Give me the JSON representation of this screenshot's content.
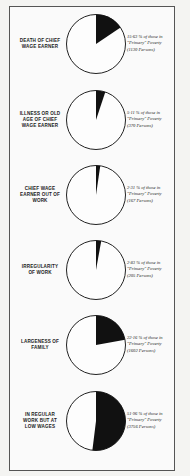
{
  "chart_data": {
    "type": "pie",
    "title": "",
    "charts": [
      {
        "cause": "Death of Chief Wage Earner",
        "percent": 15.63,
        "persons": 1130
      },
      {
        "cause": "Illness or Old Age of Chief Wage Earner",
        "percent": 5.11,
        "persons": 370
      },
      {
        "cause": "Chief Wage Earner Out of Work",
        "percent": 2.31,
        "persons": 167
      },
      {
        "cause": "Irregularity of Work",
        "percent": 2.83,
        "persons": 205
      },
      {
        "cause": "Largeness of Family",
        "percent": 22.16,
        "persons": 1602
      },
      {
        "cause": "In Regular Work but at Low Wages",
        "percent": 51.96,
        "persons": 3756
      }
    ],
    "legend": "Shaded sector = share of those in \"Primary\" Poverty"
  },
  "rows": [
    {
      "label_lines": [
        "Death of Chief",
        "Wage Earner"
      ],
      "caption": [
        "15·63 % of those in",
        "\"Primary\" Poverty",
        "(1130 Persons)"
      ],
      "percent": 15.63
    },
    {
      "label_lines": [
        "Illness or Old",
        "Age of Chief",
        "Wage Earner"
      ],
      "caption": [
        "5·11 % of those in",
        "\"Primary\" Poverty",
        "(370 Persons)"
      ],
      "percent": 5.11
    },
    {
      "label_lines": [
        "Chief Wage",
        "Earner Out of",
        "Work"
      ],
      "caption": [
        "2·31 % of those in",
        "\"Primary\" Poverty",
        "(167 Persons)"
      ],
      "percent": 2.31
    },
    {
      "label_lines": [
        "Irregularity",
        "of Work"
      ],
      "caption": [
        "2·83 % of those in",
        "\"Primary\" Poverty",
        "(205 Persons)"
      ],
      "percent": 2.83
    },
    {
      "label_lines": [
        "Largeness of",
        "Family"
      ],
      "caption": [
        "22·16 % of those in",
        "\"Primary\" Poverty",
        "(1602 Persons)"
      ],
      "percent": 22.16
    },
    {
      "label_lines": [
        "In Regular",
        "Work but at",
        "Low Wages"
      ],
      "caption": [
        "51·96 % of those in",
        "\"Primary\" Poverty",
        "(3756 Persons)"
      ],
      "percent": 51.96
    }
  ]
}
